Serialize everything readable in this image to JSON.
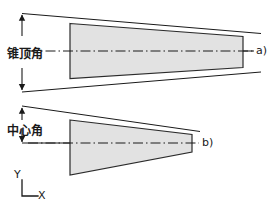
{
  "figure": {
    "width": 277,
    "height": 215,
    "background_color": "#ffffff",
    "line_color": "#1a1a1a",
    "shape_fill_color": "#e2e2e2",
    "shape_stroke_color": "#2b2b2b"
  },
  "labels": {
    "cone_apex_angle": "锥顶角",
    "center_angle": "中心角",
    "part_a": "a)",
    "part_b": "b)",
    "axis_y": "Y",
    "axis_x": "X"
  },
  "icons": {
    "axis_indicator": "axis-corner-icon",
    "dimension_arrow_up": "arrow-up-icon",
    "dimension_arrow_down": "arrow-down-icon",
    "centerline": "dash-dot-centerline-icon"
  },
  "diagram_data": {
    "type": "technical-drawing",
    "views": [
      {
        "id": "a",
        "name": "cone-apex-angle-view",
        "label": "a)",
        "annotation": "锥顶角",
        "shape": "trapezoid",
        "taper": "shallow",
        "centerline_y": 51,
        "body_points": "70,23 243,36 243,68 70,78",
        "angle_line_upper": "22,13 258,33",
        "angle_line_lower": "22,91 258,72",
        "dimension_arrow_x": 22,
        "dimension_top_y": 13,
        "dimension_bottom_y": 91
      },
      {
        "id": "b",
        "name": "center-angle-view",
        "label": "b)",
        "annotation": "中心角",
        "shape": "tapered-wedge",
        "taper": "steep",
        "centerline_y": 143,
        "body_points": "70,120 192,135 192,152 70,175",
        "angle_line_upper": "22,106 198,131",
        "angle_line_lower": "22,143 198,143",
        "dimension_arrow_x": 22,
        "dimension_top_y": 106,
        "dimension_bottom_y": 143
      }
    ],
    "axis_indicator": {
      "origin_x": 22,
      "origin_y": 196,
      "y_axis_label": "Y",
      "x_axis_label": "X"
    }
  }
}
